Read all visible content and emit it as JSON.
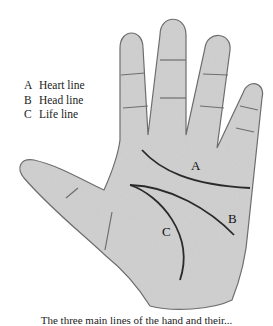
{
  "diagram": {
    "legend": [
      {
        "key": "A",
        "label": "Heart line"
      },
      {
        "key": "B",
        "label": "Head line"
      },
      {
        "key": "C",
        "label": "Life line"
      }
    ],
    "labels": {
      "a": "A",
      "b": "B",
      "c": "C"
    },
    "caption": "The three main lines of the hand and their...",
    "colors": {
      "skin": "#cfcfcf",
      "outline": "#6b6b6b",
      "line": "#2a2a2a",
      "background": "#ffffff"
    }
  }
}
